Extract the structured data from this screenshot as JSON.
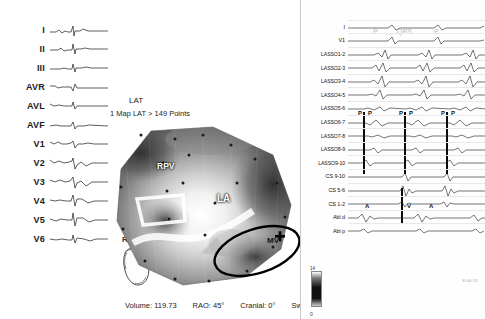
{
  "ecg": {
    "panel_name": "12-lead surface ECG",
    "leads": [
      {
        "label": "I"
      },
      {
        "label": "II"
      },
      {
        "label": "III"
      },
      {
        "label": "AVR"
      },
      {
        "label": "AVL"
      },
      {
        "label": "AVF"
      },
      {
        "label": "V1"
      },
      {
        "label": "V2"
      },
      {
        "label": "V3"
      },
      {
        "label": "V4"
      },
      {
        "label": "V5"
      },
      {
        "label": "V6"
      }
    ]
  },
  "map": {
    "map_type_label": "LAT",
    "map_summary": "1 Map LAT > 149 Points",
    "view_label": "RAO",
    "anatomy_tags": [
      {
        "id": "rpv",
        "label": "RPV"
      },
      {
        "id": "la",
        "label": "LA"
      },
      {
        "id": "mv",
        "label": "MV"
      }
    ],
    "marker_symbol": "✚"
  },
  "status": {
    "volume": "Volume: 119.73",
    "rao": "RAO: 45°",
    "cranial": "Cranial: 0°",
    "swivel": "Swivel: 0°"
  },
  "egm": {
    "panel_name": "Intracardiac electrograms",
    "channels": [
      {
        "label": "I"
      },
      {
        "label": "V1"
      },
      {
        "label": "LASSO1-2"
      },
      {
        "label": "LASSO2-3"
      },
      {
        "label": "LASSO3-4"
      },
      {
        "label": "LASSO4-5"
      },
      {
        "label": "LASSO5-6"
      },
      {
        "label": "LASSO6-7"
      },
      {
        "label": "LASSO7-8"
      },
      {
        "label": "LASSO8-9"
      },
      {
        "label": "LASSO9-10"
      },
      {
        "label": "CS 9-10"
      },
      {
        "label": "CS 5-6"
      },
      {
        "label": "CS 1-2"
      },
      {
        "label": "Abl d"
      },
      {
        "label": "Abl p"
      }
    ],
    "annotations": {
      "p_wave_1": "P",
      "qrs": "QRS",
      "p_wave_2": "P",
      "p_pairs": [
        "P",
        "P",
        "P",
        "P",
        "P",
        "P"
      ],
      "atrial": [
        "A",
        "A",
        "A"
      ],
      "ventricular": "V"
    },
    "scale_top": "14",
    "scale_bottom": "0",
    "timestamp": "8:44:15"
  },
  "colors": {
    "background": "#ffffff",
    "trace": "#1a1a1a",
    "annotation_gray": "#b9b9b9",
    "marker_black": "#000000"
  }
}
